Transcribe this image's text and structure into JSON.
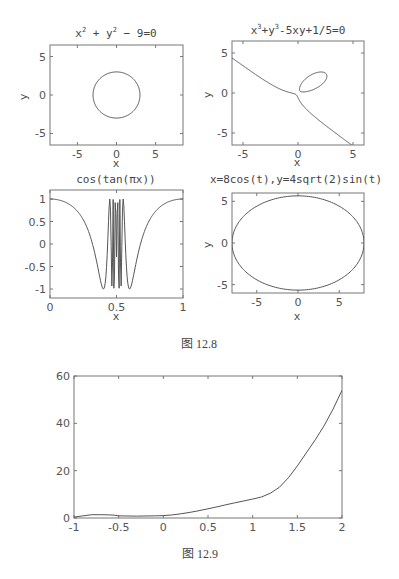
{
  "chart_data": [
    {
      "id": "implicit-circle",
      "type": "line",
      "title": "x²+y²−9=0",
      "equation": "x^2+y^2-9=0",
      "xlabel": "x",
      "ylabel": "y",
      "xlim": [
        -8.5,
        8.5
      ],
      "ylim": [
        -6.5,
        6.5
      ],
      "xticks": [
        -5,
        0,
        5
      ],
      "yticks": [
        -5,
        0,
        5
      ],
      "xtick_labels": [
        "-5",
        "0",
        "5"
      ],
      "ytick_labels": [
        "-5",
        "0",
        "5"
      ],
      "grid": false
    },
    {
      "id": "implicit-cubic",
      "type": "line",
      "title": "x³+y³−5xy+1/5=0",
      "equation": "x^3+y^3-5xy+1/5=0",
      "xlabel": "x",
      "ylabel": "y",
      "xlim": [
        -6,
        6
      ],
      "ylim": [
        -6.5,
        6.5
      ],
      "xticks": [
        -5,
        0,
        5
      ],
      "yticks": [
        -5,
        0,
        5
      ],
      "xtick_labels": [
        "-5",
        "0",
        "5"
      ],
      "ytick_labels": [
        "-5",
        "0",
        "5"
      ],
      "grid": false
    },
    {
      "id": "cos-tan",
      "type": "line",
      "title": "cos(tan(πx))",
      "equation": "cos(tan(pi*x))",
      "xlabel": "x",
      "ylabel": "",
      "xlim": [
        0,
        1
      ],
      "ylim": [
        -1.2,
        1.2
      ],
      "xticks": [
        0,
        0.5,
        1
      ],
      "yticks": [
        -1,
        -0.5,
        0,
        0.5,
        1
      ],
      "xtick_labels": [
        "0",
        "0.5",
        "1"
      ],
      "ytick_labels": [
        "-1",
        "-0.5",
        "0",
        "0.5",
        "1"
      ],
      "grid": false
    },
    {
      "id": "parametric-ellipse",
      "type": "line",
      "title": "x=8cos(t),y=4sqrt(2)sin(t)",
      "equation": "x=8cos(t), y=4sqrt(2)sin(t)",
      "xlabel": "x",
      "ylabel": "y",
      "xlim": [
        -8,
        8
      ],
      "ylim": [
        -6,
        6
      ],
      "xticks": [
        -5,
        0,
        5
      ],
      "yticks": [
        -5,
        0,
        5
      ],
      "xtick_labels": [
        "-5",
        "0",
        "5"
      ],
      "ytick_labels": [
        "-5",
        "0",
        "5"
      ],
      "grid": false
    },
    {
      "id": "growth-curve",
      "type": "line",
      "title": "",
      "xlabel": "",
      "ylabel": "",
      "xlim": [
        -1,
        2
      ],
      "ylim": [
        0,
        60
      ],
      "xticks": [
        -1,
        -0.5,
        0,
        0.5,
        1,
        1.5,
        2
      ],
      "yticks": [
        0,
        20,
        40,
        60
      ],
      "xtick_labels": [
        "-1",
        "-0.5",
        "0",
        "0.5",
        "1",
        "1.5",
        "2"
      ],
      "ytick_labels": [
        "0",
        "20",
        "40",
        "60"
      ],
      "x": [
        -1,
        -0.9,
        -0.8,
        -0.7,
        -0.6,
        -0.55,
        -0.5,
        -0.3,
        -0.1,
        0,
        0.1,
        0.2,
        0.3,
        0.4,
        0.5,
        0.6,
        0.7,
        0.8,
        0.9,
        1.0,
        1.1,
        1.2,
        1.3,
        1.4,
        1.5,
        1.6,
        1.7,
        1.8,
        1.9,
        2.0
      ],
      "y": [
        0.4,
        0.9,
        1.4,
        1.4,
        1.3,
        1.2,
        0.9,
        0.8,
        0.9,
        1.0,
        1.3,
        1.8,
        2.4,
        3.1,
        3.9,
        4.7,
        5.6,
        6.4,
        7.2,
        8.0,
        8.9,
        10.5,
        13.0,
        17.0,
        22.0,
        27.5,
        33.0,
        39.0,
        46.0,
        54.0
      ],
      "grid": false
    }
  ],
  "captions": {
    "figure_12_8": "图 12.8",
    "figure_12_9": "图 12.9"
  }
}
